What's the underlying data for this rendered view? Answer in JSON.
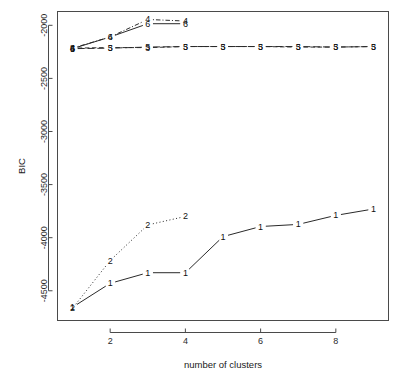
{
  "chart_data": {
    "type": "line",
    "title": "",
    "xlabel": "number of clusters",
    "ylabel": "BIC",
    "xlim": [
      0.6,
      9.4
    ],
    "ylim": [
      -4780,
      -1870
    ],
    "xticks": [
      2,
      4,
      6,
      8
    ],
    "xtick_labels": [
      "2",
      "4",
      "6",
      "8"
    ],
    "yticks": [
      -2000,
      -2500,
      -3000,
      -3500,
      -4000,
      -4500
    ],
    "ytick_labels": [
      "-2000",
      "-2500",
      "-3000",
      "-3500",
      "-4000",
      "-4500"
    ],
    "grid": false,
    "legend": "none",
    "point_label_mode": "model-number-as-marker",
    "x": [
      1,
      2,
      3,
      4,
      5,
      6,
      7,
      8,
      9
    ],
    "series": [
      {
        "name": "1",
        "marker": "1",
        "linestyle": "solid",
        "color": "#2a2a2a",
        "x": [
          1,
          2,
          3,
          4,
          5,
          6,
          7,
          8,
          9
        ],
        "values": [
          -4655,
          -4430,
          -4330,
          -4330,
          -3990,
          -3895,
          -3875,
          -3790,
          -3730
        ]
      },
      {
        "name": "2",
        "marker": "2",
        "linestyle": "dotted",
        "color": "#2a2a2a",
        "x": [
          1,
          2,
          3,
          4
        ],
        "values": [
          -4665,
          -4215,
          -3880,
          -3800
        ]
      },
      {
        "name": "3",
        "marker": "3",
        "linestyle": "dashed",
        "color": "#2a2a2a",
        "x": [
          1,
          2,
          3,
          4,
          5,
          6,
          7,
          8,
          9
        ],
        "values": [
          -2215,
          -2210,
          -2210,
          -2200,
          -2200,
          -2200,
          -2205,
          -2205,
          -2200
        ]
      },
      {
        "name": "4",
        "marker": "4",
        "linestyle": "dotdash",
        "color": "#2a2a2a",
        "x": [
          1,
          2,
          3,
          4
        ],
        "values": [
          -2215,
          -2110,
          -1945,
          -1960
        ]
      },
      {
        "name": "5",
        "marker": "5",
        "linestyle": "longdash",
        "color": "#2a2a2a",
        "x": [
          1,
          2,
          3,
          4,
          5,
          6,
          7,
          8,
          9
        ],
        "values": [
          -2220,
          -2215,
          -2205,
          -2200,
          -2200,
          -2200,
          -2200,
          -2205,
          -2200
        ]
      },
      {
        "name": "6",
        "marker": "6",
        "linestyle": "solid",
        "color": "#2a2a2a",
        "x": [
          1,
          2,
          3,
          4
        ],
        "values": [
          -2220,
          -2110,
          -1985,
          -1985
        ]
      }
    ]
  }
}
